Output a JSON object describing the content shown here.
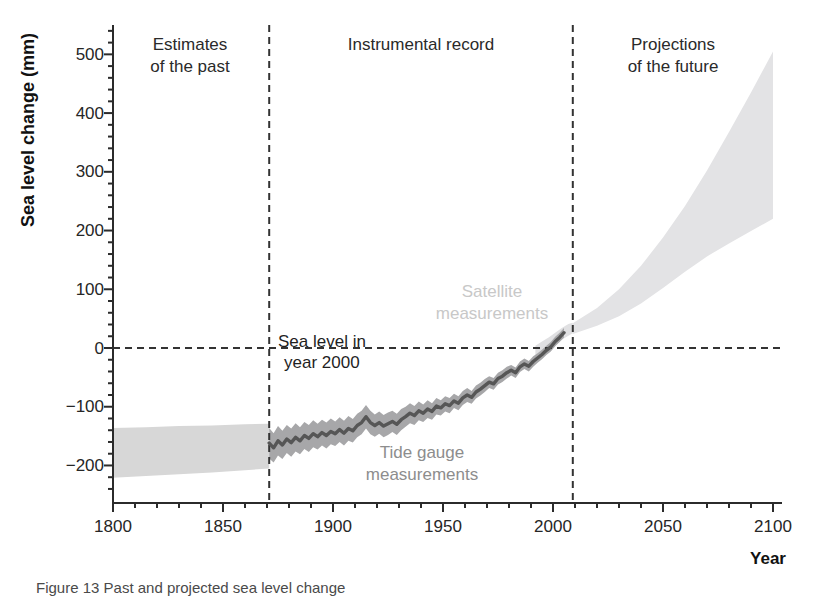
{
  "figure": {
    "caption": "Figure 13 Past and projected sea level change"
  },
  "colors": {
    "background": "#ffffff",
    "axis": "#2b2b2b",
    "dashed_line": "#333333",
    "tick_text": "#262626",
    "past_band": "#d7d7d7",
    "tide_band": "#a7a7a9",
    "tide_line": "#565656",
    "satellite_band": "#e0e0e2",
    "projection_band": "#e3e3e5",
    "satellite_label_text": "#c8c8c8",
    "tide_label_text": "#8d8d8d"
  },
  "chart_data": {
    "type": "area",
    "title": "",
    "xlabel": "Year",
    "ylabel": "Sea level change (mm)",
    "xlim": [
      1800,
      2100
    ],
    "ylim": [
      -260,
      550
    ],
    "grid": false,
    "legend": "none (in-plot text annotations)",
    "x_ticks": [
      {
        "v": 1800,
        "label": "1800"
      },
      {
        "v": 1850,
        "label": "1850"
      },
      {
        "v": 1900,
        "label": "1900"
      },
      {
        "v": 1950,
        "label": "1950"
      },
      {
        "v": 2000,
        "label": "2000"
      },
      {
        "v": 2050,
        "label": "2050"
      },
      {
        "v": 2100,
        "label": "2100"
      }
    ],
    "y_ticks": [
      {
        "v": 500,
        "label": "500"
      },
      {
        "v": 400,
        "label": "400"
      },
      {
        "v": 300,
        "label": "300"
      },
      {
        "v": 200,
        "label": "200"
      },
      {
        "v": 100,
        "label": "100"
      },
      {
        "v": 0,
        "label": "0"
      },
      {
        "v": -100,
        "label": "−100"
      },
      {
        "v": -200,
        "label": "−200"
      }
    ],
    "x_minor_step": 10,
    "y_minor_step": 20,
    "boundaries": {
      "instrumental_start_year": 1871,
      "projections_start_year": 2009,
      "zero_reference_mm": 0
    },
    "regions": {
      "past": {
        "line1": "Estimates",
        "line2": "of the past",
        "x_range": [
          1800,
          1871
        ]
      },
      "instrumental": {
        "line1": "Instrumental record",
        "x_range": [
          1871,
          2009
        ]
      },
      "future": {
        "line1": "Projections",
        "line2": "of the future",
        "x_range": [
          2009,
          2100
        ]
      }
    },
    "annotations": {
      "zero_line": {
        "line1": "Sea level in",
        "line2": "year 2000"
      },
      "satellite": {
        "line1": "Satellite",
        "line2": "measurements"
      },
      "tide": {
        "line1": "Tide gauge",
        "line2": "measurements"
      }
    },
    "series": [
      {
        "name": "Estimates of the past",
        "style": "band",
        "columns": [
          "year",
          "lo_mm",
          "hi_mm"
        ],
        "points": [
          [
            1800,
            -221,
            -136
          ],
          [
            1815,
            -218,
            -135
          ],
          [
            1830,
            -215,
            -133
          ],
          [
            1845,
            -212,
            -132
          ],
          [
            1860,
            -208,
            -130
          ],
          [
            1871,
            -205,
            -129
          ]
        ]
      },
      {
        "name": "Satellite measurements",
        "style": "band",
        "columns": [
          "year",
          "mean_mm",
          "halfwidth_mm"
        ],
        "points": [
          [
            1992,
            -6,
            10
          ],
          [
            1995,
            1,
            10
          ],
          [
            1998,
            8,
            10
          ],
          [
            2001,
            16,
            10
          ],
          [
            2004,
            24,
            10
          ],
          [
            2007,
            31,
            10
          ],
          [
            2009,
            34,
            9
          ]
        ]
      },
      {
        "name": "Projections of the future",
        "style": "band",
        "columns": [
          "year",
          "lo_mm",
          "hi_mm"
        ],
        "points": [
          [
            2009,
            24,
            42
          ],
          [
            2020,
            38,
            68
          ],
          [
            2030,
            54,
            100
          ],
          [
            2040,
            76,
            140
          ],
          [
            2050,
            102,
            188
          ],
          [
            2060,
            130,
            242
          ],
          [
            2070,
            156,
            302
          ],
          [
            2080,
            178,
            368
          ],
          [
            2090,
            199,
            435
          ],
          [
            2100,
            220,
            505
          ]
        ]
      },
      {
        "name": "Tide gauge measurements",
        "style": "band+line",
        "columns": [
          "year",
          "mean_mm",
          "halfwidth_mm"
        ],
        "points": [
          [
            1871,
            -162,
            26
          ],
          [
            1873,
            -170,
            25
          ],
          [
            1875,
            -158,
            25
          ],
          [
            1877,
            -165,
            24
          ],
          [
            1879,
            -155,
            24
          ],
          [
            1881,
            -161,
            24
          ],
          [
            1883,
            -152,
            24
          ],
          [
            1885,
            -158,
            23
          ],
          [
            1887,
            -149,
            23
          ],
          [
            1889,
            -154,
            23
          ],
          [
            1891,
            -146,
            23
          ],
          [
            1893,
            -151,
            22
          ],
          [
            1895,
            -144,
            22
          ],
          [
            1897,
            -149,
            22
          ],
          [
            1899,
            -142,
            22
          ],
          [
            1901,
            -146,
            21
          ],
          [
            1903,
            -139,
            21
          ],
          [
            1905,
            -145,
            21
          ],
          [
            1907,
            -137,
            21
          ],
          [
            1909,
            -141,
            20
          ],
          [
            1911,
            -132,
            20
          ],
          [
            1913,
            -127,
            20
          ],
          [
            1915,
            -117,
            20
          ],
          [
            1917,
            -127,
            20
          ],
          [
            1919,
            -132,
            19
          ],
          [
            1921,
            -127,
            19
          ],
          [
            1923,
            -133,
            19
          ],
          [
            1925,
            -129,
            19
          ],
          [
            1927,
            -125,
            18
          ],
          [
            1929,
            -130,
            18
          ],
          [
            1931,
            -122,
            18
          ],
          [
            1933,
            -117,
            17
          ],
          [
            1935,
            -111,
            17
          ],
          [
            1937,
            -115,
            16
          ],
          [
            1939,
            -107,
            16
          ],
          [
            1941,
            -111,
            15
          ],
          [
            1943,
            -104,
            15
          ],
          [
            1945,
            -108,
            14
          ],
          [
            1947,
            -99,
            14
          ],
          [
            1949,
            -102,
            13
          ],
          [
            1951,
            -95,
            13
          ],
          [
            1953,
            -98,
            13
          ],
          [
            1955,
            -90,
            12
          ],
          [
            1957,
            -94,
            12
          ],
          [
            1959,
            -85,
            12
          ],
          [
            1961,
            -80,
            12
          ],
          [
            1963,
            -84,
            11
          ],
          [
            1965,
            -75,
            11
          ],
          [
            1967,
            -70,
            11
          ],
          [
            1969,
            -64,
            11
          ],
          [
            1971,
            -58,
            10
          ],
          [
            1973,
            -61,
            10
          ],
          [
            1975,
            -52,
            10
          ],
          [
            1977,
            -48,
            10
          ],
          [
            1979,
            -42,
            10
          ],
          [
            1981,
            -38,
            9
          ],
          [
            1983,
            -42,
            9
          ],
          [
            1985,
            -32,
            9
          ],
          [
            1987,
            -27,
            9
          ],
          [
            1989,
            -31,
            9
          ],
          [
            1991,
            -23,
            9
          ],
          [
            1993,
            -17,
            8
          ],
          [
            1995,
            -11,
            8
          ],
          [
            1997,
            -4,
            8
          ],
          [
            1999,
            2,
            8
          ],
          [
            2001,
            11,
            8
          ],
          [
            2003,
            18,
            8
          ],
          [
            2005,
            26,
            8
          ]
        ]
      }
    ]
  }
}
